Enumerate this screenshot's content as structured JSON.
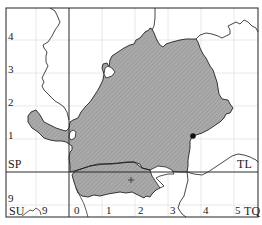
{
  "map": {
    "type": "grid-map",
    "frame": {
      "x0": 6,
      "y0": 8,
      "x1": 258,
      "y1": 217
    },
    "grid_squares": [
      {
        "code": "SP",
        "label_pos": "lower-left of upper-left square"
      },
      {
        "code": "TL",
        "label_pos": "lower-right of upper-right square"
      },
      {
        "code": "SU",
        "label_pos": "bottom-left"
      },
      {
        "code": "TQ",
        "label_pos": "bottom-right"
      }
    ],
    "labels": {
      "sp": "SP",
      "tl": "TL",
      "su": "SU",
      "tq": "TQ",
      "su_9": "9",
      "left_axis": [
        "4",
        "3",
        "2",
        "1",
        "9"
      ],
      "bottom_axis": [
        "0",
        "1",
        "2",
        "3",
        "4",
        "5"
      ]
    },
    "colors": {
      "region_fill": "#a9a9a9",
      "region_hatch": "#8f8f8f",
      "border": "#222222",
      "grid_major": "#333333",
      "grid_minor": "#e0e0e0",
      "river": "#333333"
    },
    "markers": [
      {
        "kind": "dot",
        "label": "",
        "x": 193,
        "y": 136
      },
      {
        "kind": "cross",
        "label": "+",
        "x": 131,
        "y": 180
      }
    ]
  }
}
